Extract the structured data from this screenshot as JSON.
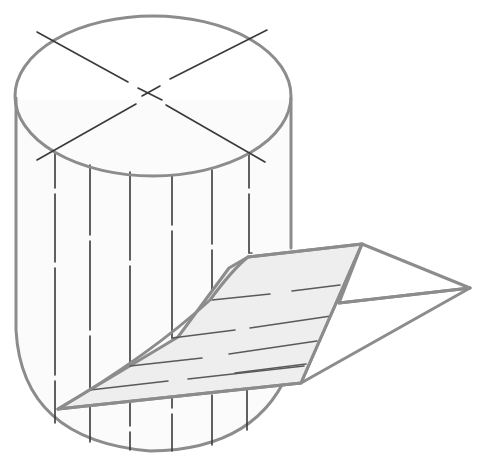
{
  "diagram": {
    "title": "Cylinder cut by an inclined plane",
    "colors": {
      "outline": "#8c8c8c",
      "lines": "#3a3a3a",
      "plane_fill": "#eeeeee",
      "background": "#ffffff"
    },
    "components": [
      "top-ellipse",
      "diameter-lines",
      "cylinder-sides",
      "vertical-rulings",
      "inclined-plane",
      "plane-hatch-lines",
      "wedge"
    ],
    "text_labels": []
  }
}
